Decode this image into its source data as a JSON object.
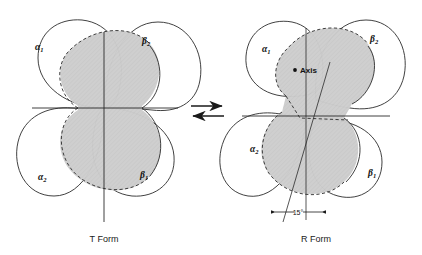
{
  "figure": {
    "title_left": "T Form",
    "title_right": "R Form",
    "axis_label": "Axis",
    "angle_label": "15°",
    "equilibrium": "equilibrium-double-arrow"
  },
  "subunits": {
    "alpha1": {
      "greek": "α",
      "sub": "1"
    },
    "alpha2": {
      "greek": "α",
      "sub": "2"
    },
    "beta1": {
      "greek": "β",
      "sub": "1"
    },
    "beta2": {
      "greek": "β",
      "sub": "2"
    }
  },
  "colors": {
    "outline": "#2b2b2b",
    "white_lobe": "#ffffff",
    "light_lobe": "#c9c9c9",
    "dark_lobe": "#a2a2a2",
    "background": "#ffffff"
  }
}
